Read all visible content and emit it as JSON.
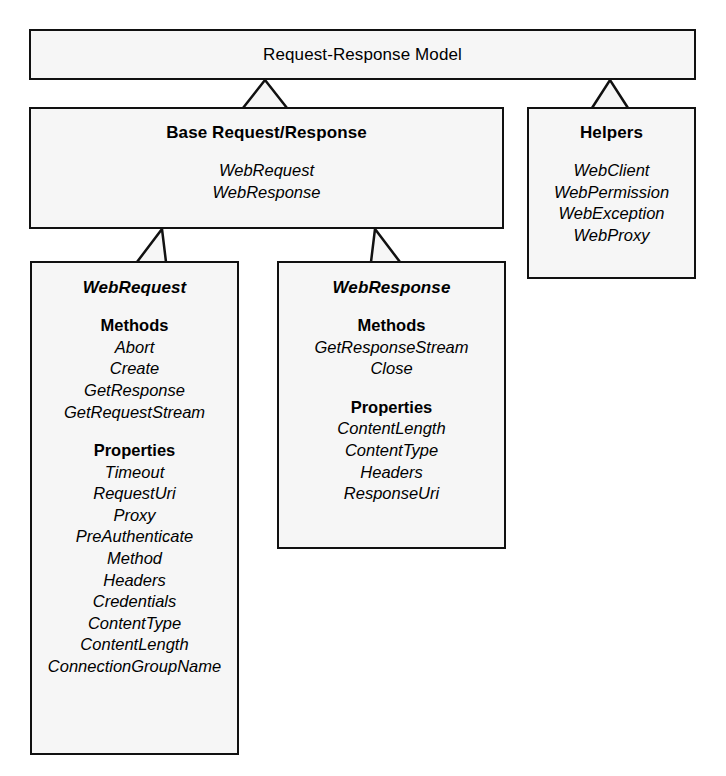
{
  "diagram": {
    "title": "Request-Response Model",
    "style": {
      "box_fill": "#f6f6f6",
      "box_border": "#111111",
      "text_color": "#000000",
      "background": "#ffffff"
    },
    "nodes": {
      "root": {
        "title": "Request-Response Model"
      },
      "base": {
        "title": "Base Request/Response",
        "members": [
          "WebRequest",
          "WebResponse"
        ]
      },
      "helpers": {
        "title": "Helpers",
        "members": [
          "WebClient",
          "WebPermission",
          "WebException",
          "WebProxy"
        ]
      },
      "webrequest": {
        "title": "WebRequest",
        "sections": [
          {
            "heading": "Methods",
            "items": [
              "Abort",
              "Create",
              "GetResponse",
              "GetRequestStream"
            ]
          },
          {
            "heading": "Properties",
            "items": [
              "Timeout",
              "RequestUri",
              "Proxy",
              "PreAuthenticate",
              "Method",
              "Headers",
              "Credentials",
              "ContentType",
              "ContentLength",
              "ConnectionGroupName"
            ]
          }
        ]
      },
      "webresponse": {
        "title": "WebResponse",
        "sections": [
          {
            "heading": "Methods",
            "items": [
              "GetResponseStream",
              "Close"
            ]
          },
          {
            "heading": "Properties",
            "items": [
              "ContentLength",
              "ContentType",
              "Headers",
              "ResponseUri"
            ]
          }
        ]
      }
    },
    "connectors": [
      {
        "from": "base",
        "to": "root",
        "kind": "generalization"
      },
      {
        "from": "helpers",
        "to": "root",
        "kind": "generalization"
      },
      {
        "from": "webrequest",
        "to": "base",
        "kind": "generalization"
      },
      {
        "from": "webresponse",
        "to": "base",
        "kind": "generalization"
      }
    ]
  }
}
